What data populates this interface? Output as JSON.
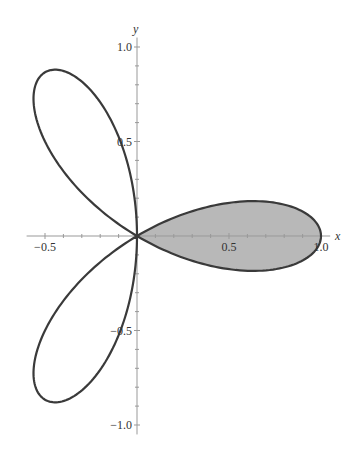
{
  "chart_data": {
    "type": "line",
    "subtype": "polar",
    "equation": "r = cos(3θ)",
    "title": "",
    "xlabel": "x",
    "ylabel": "y",
    "xlim": [
      -0.6,
      1.05
    ],
    "ylim": [
      -1.05,
      1.05
    ],
    "grid": false,
    "legend": null,
    "x_ticks": [
      {
        "value": -0.5,
        "label": "-0.5"
      },
      {
        "value": 0.5,
        "label": "0.5"
      },
      {
        "value": 1.0,
        "label": "1.0"
      }
    ],
    "y_ticks": [
      {
        "value": 1.0,
        "label": "1.0"
      },
      {
        "value": 0.5,
        "label": "0.5"
      },
      {
        "value": -0.5,
        "label": "-0.5"
      },
      {
        "value": -1.0,
        "label": "-1.0"
      }
    ],
    "series": [
      {
        "name": "three-leaved rose",
        "theta_range": [
          0,
          3.14159265
        ],
        "samples": 360,
        "stroke": "#3a3a3a"
      }
    ],
    "shaded_region": {
      "description": "petal on positive x-axis",
      "theta_range": [
        -0.5235988,
        0.5235988
      ],
      "fill": "#b8b8b8"
    },
    "layout": {
      "origin_px": [
        137,
        236
      ],
      "px_per_unit_x": 184,
      "px_per_unit_y": 189
    }
  }
}
